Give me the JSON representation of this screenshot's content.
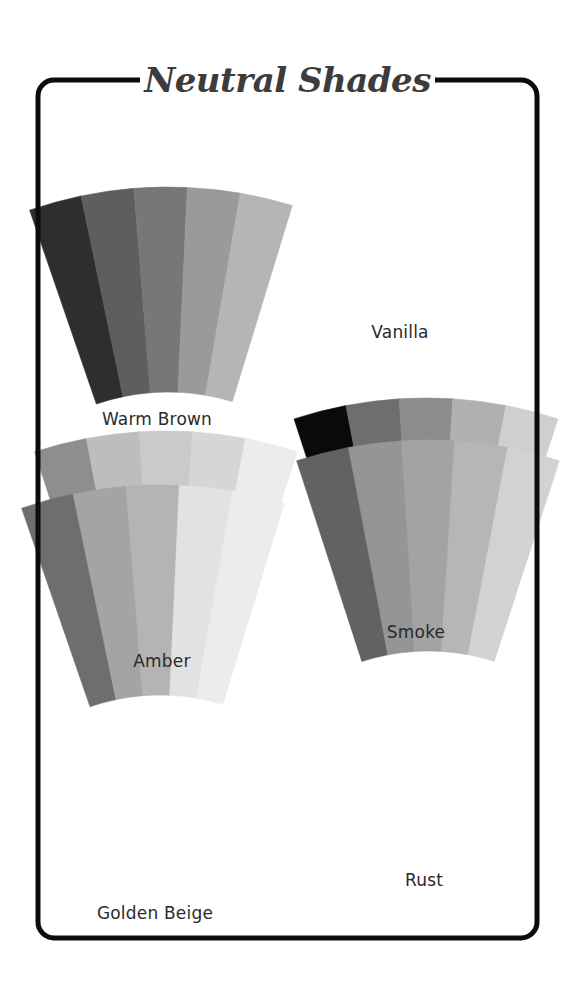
{
  "title": "Neutral Shades",
  "frame": {
    "x": 38,
    "y": 80,
    "width": 499,
    "height": 858,
    "radius": 16,
    "stroke": "#0c0c0c",
    "stroke_width": 5
  },
  "swatches": [
    {
      "name": "Warm Brown",
      "label_pos": {
        "x": 157,
        "y": 409
      },
      "fan": {
        "cx": 168,
        "cy": 612,
        "r_outer": 425,
        "r_inner": 220,
        "half_angle": 18,
        "rotate": -1
      },
      "colors": [
        "#2e2e2e",
        "#5e5e5e",
        "#777777",
        "#9a9a9a",
        "#b5b5b5"
      ]
    },
    {
      "name": "Vanilla",
      "label_pos": {
        "x": 400,
        "y": 322
      },
      "fan": null,
      "colors": [
        "#fefefe",
        "#fefefe",
        "#ffffff",
        "#ffffff",
        "#ffffff"
      ]
    },
    {
      "name": "Smoke",
      "label_pos": {
        "x": 416,
        "y": 622
      },
      "fan": {
        "cx": 426,
        "cy": 825,
        "r_outer": 427,
        "r_inner": 215,
        "half_angle": 18,
        "rotate": 0
      },
      "colors": [
        "#0a0a0a",
        "#6e6e6e",
        "#8c8c8c",
        "#b0b0b0",
        "#cfcfcf"
      ]
    },
    {
      "name": "Amber",
      "label_pos": {
        "x": 162,
        "y": 651
      },
      "fan": {
        "cx": 166,
        "cy": 856,
        "r_outer": 425,
        "r_inner": 218,
        "half_angle": 18,
        "rotate": 0
      },
      "colors": [
        "#8e8e8e",
        "#bdbdbd",
        "#cacaca",
        "#d6d6d6",
        "#ececec"
      ]
    },
    {
      "name": "Rust",
      "label_pos": {
        "x": 424,
        "y": 870
      },
      "fan": {
        "cx": 428,
        "cy": 865,
        "r_outer": 425,
        "r_inner": 214,
        "half_angle": 18,
        "rotate": 0
      },
      "colors": [
        "#626262",
        "#959595",
        "#a3a3a3",
        "#b6b6b6",
        "#d2d2d2"
      ]
    },
    {
      "name": "Golden Beige",
      "label_pos": {
        "x": 155,
        "y": 903
      },
      "fan": {
        "cx": 160,
        "cy": 910,
        "r_outer": 425,
        "r_inner": 215,
        "half_angle": 18,
        "rotate": -1
      },
      "colors": [
        "#6e6e6e",
        "#a4a4a4",
        "#b4b4b4",
        "#e2e2e2",
        "#ececec"
      ]
    }
  ]
}
